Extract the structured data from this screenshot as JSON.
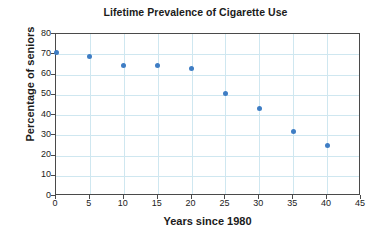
{
  "chart_data": {
    "type": "scatter",
    "title": "Lifetime Prevalence of Cigarette Use",
    "xlabel": "Years since 1980",
    "ylabel": "Percentage of seniors",
    "xlim": [
      0,
      45
    ],
    "ylim": [
      0,
      80
    ],
    "xticks": [
      0,
      5,
      10,
      15,
      20,
      25,
      30,
      35,
      40,
      45
    ],
    "yticks": [
      0,
      10,
      20,
      30,
      40,
      50,
      60,
      70,
      80
    ],
    "grid": true,
    "legend": null,
    "x": [
      0,
      5,
      10,
      15,
      20,
      25,
      30,
      35,
      40
    ],
    "y": [
      71,
      69,
      64.5,
      64.5,
      63,
      50.5,
      43,
      32,
      25
    ],
    "series": [
      {
        "name": "Percentage of seniors",
        "points": [
          {
            "x": 0,
            "y": 71
          },
          {
            "x": 5,
            "y": 69
          },
          {
            "x": 10,
            "y": 64.5
          },
          {
            "x": 15,
            "y": 64.5
          },
          {
            "x": 20,
            "y": 63
          },
          {
            "x": 25,
            "y": 50.5
          },
          {
            "x": 30,
            "y": 43
          },
          {
            "x": 35,
            "y": 32
          },
          {
            "x": 40,
            "y": 25
          }
        ]
      }
    ]
  },
  "colors": {
    "marker": "#3e7dc4",
    "grid": "#cfe7f0",
    "axis": "#4a4a4a",
    "text": "#1b1b1b",
    "background": "#ffffff"
  }
}
